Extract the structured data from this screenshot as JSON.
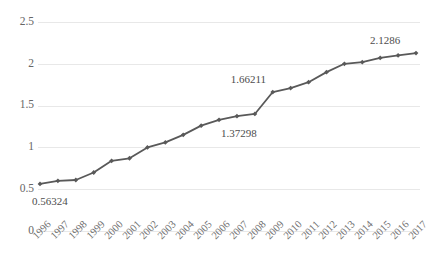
{
  "chart_data": {
    "type": "line",
    "title": "",
    "xlabel": "",
    "ylabel": "",
    "categories": [
      "1996",
      "1997",
      "1998",
      "1999",
      "2000",
      "2001",
      "2002",
      "2003",
      "2004",
      "2005",
      "2006",
      "2007",
      "2008",
      "2009",
      "2010",
      "2011",
      "2012",
      "2013",
      "2014",
      "2015",
      "2016",
      "2017"
    ],
    "values": [
      0.56324,
      0.6,
      0.61,
      0.7,
      0.84,
      0.87,
      1.0,
      1.06,
      1.15,
      1.26,
      1.33,
      1.37298,
      1.4,
      1.66211,
      1.71,
      1.78,
      1.9,
      2.0,
      2.02,
      2.07,
      2.1,
      2.1286
    ],
    "ylim": [
      0,
      2.5
    ],
    "yticks": [
      0,
      0.5,
      1,
      1.5,
      2,
      2.5
    ],
    "ytick_labels": [
      "0",
      "0.5",
      "1",
      "1.5",
      "2",
      "2.5"
    ],
    "grid": true,
    "legend": "none",
    "series_color": "#595959",
    "grid_color": "#e8e8e8",
    "marker": "diamond",
    "point_labels": [
      {
        "category": "1996",
        "text": "0.56324"
      },
      {
        "category": "2007",
        "text": "1.37298"
      },
      {
        "category": "2009",
        "text": "1.66211"
      },
      {
        "category": "2017",
        "text": "2.1286"
      }
    ]
  }
}
